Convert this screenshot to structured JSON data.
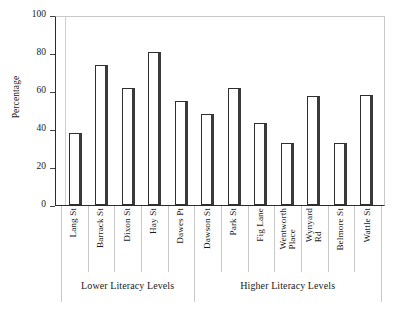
{
  "chart_data": {
    "type": "bar",
    "title": "",
    "subtitle": "",
    "xlabel": "",
    "ylabel": "Percentage",
    "ylim": [
      0,
      100
    ],
    "yticks": [
      0,
      20,
      40,
      60,
      80,
      100
    ],
    "grid": false,
    "legend": null,
    "categories": [
      "Lang St",
      "Barrack St",
      "Dixon St",
      "Hay St",
      "Dawes Pt",
      "Dawson St",
      "Park St",
      "Fig Lane",
      "Wentworth Place",
      "Wynyard Rd",
      "Belmore St",
      "Wattle St"
    ],
    "category_label_lines": [
      [
        "Lang St"
      ],
      [
        "Barrack St"
      ],
      [
        "Dixon St"
      ],
      [
        "Hay St"
      ],
      [
        "Dawes Pt"
      ],
      [
        "Dawson St"
      ],
      [
        "Park St"
      ],
      [
        "Fig Lane"
      ],
      [
        "Wentworth",
        "Place"
      ],
      [
        "Wynyard",
        "Rd"
      ],
      [
        "Belmore St"
      ],
      [
        "Wattle St"
      ]
    ],
    "values": [
      38,
      73.5,
      61.5,
      80.5,
      55,
      48,
      61.5,
      43,
      32.5,
      57.5,
      32.5,
      58
    ],
    "groups": [
      {
        "label": "Lower Literacy Levels",
        "start_index": 0,
        "end_index": 4
      },
      {
        "label": "Higher Literacy Levels",
        "start_index": 5,
        "end_index": 11
      }
    ],
    "bar_style": {
      "fill": "#ffffff",
      "outline": "#2f2f2f",
      "shadow": "#3a3a3a"
    },
    "axis_color": "#2b2b2b"
  },
  "top_remnant": "· · · ·  ·   ·",
  "axis": {
    "y_title": "Percentage"
  }
}
